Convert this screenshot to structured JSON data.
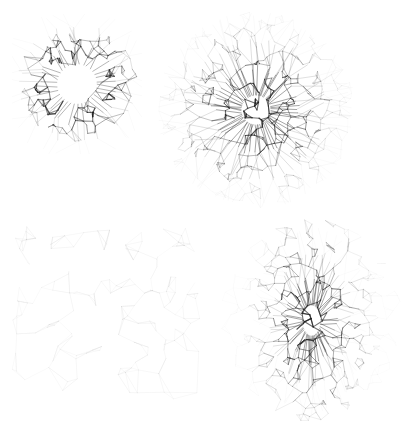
{
  "figure": {
    "background_color": "#ffffff",
    "ink_color": "#202020",
    "width": 417,
    "height": 430,
    "layout": "2x2 grid of unlabeled raster panels",
    "caption": ""
  },
  "panels": [
    {
      "id": "panel-top-left",
      "name": "toroidal-shell",
      "position": "top-left",
      "label": "",
      "morphology": "annulus",
      "description": "Ring / torus shaped mesh with open white core and radial spokes projecting outward",
      "x": 12,
      "y": 14,
      "width": 130,
      "height": 140,
      "density": 0.72,
      "core_opacity": 0.0,
      "ring_inner_radius": 22,
      "ring_outer_radius": 58,
      "spoke_count": 34,
      "cell_count": 150
    },
    {
      "id": "panel-top-right",
      "name": "radial-burst-sphere",
      "position": "top-right",
      "label": "",
      "morphology": "spheroid",
      "description": "Dense centrally concentrated spheroidal mesh surrounded by a sparse halo of filaments",
      "x": 158,
      "y": 12,
      "width": 196,
      "height": 196,
      "density": 0.9,
      "core_opacity": 0.85,
      "core_radius": 60,
      "halo_radius": 98,
      "spoke_count": 60,
      "cell_count": 420
    },
    {
      "id": "panel-bottom-left",
      "name": "sparse-network",
      "position": "bottom-left",
      "label": "",
      "morphology": "diffuse-web",
      "description": "Low density open polygonal web of faint filaments spread uniformly across the frame",
      "x": 12,
      "y": 225,
      "width": 188,
      "height": 175,
      "density": 0.22,
      "core_opacity": 0.0,
      "cell_count": 150
    },
    {
      "id": "panel-bottom-right",
      "name": "elongated-filament",
      "position": "bottom-right",
      "label": "",
      "morphology": "prolate",
      "description": "Vertically elongated dense filamentary column with sparse surrounding field",
      "x": 215,
      "y": 218,
      "width": 193,
      "height": 205,
      "density": 0.88,
      "core_opacity": 0.8,
      "core_radius_x": 52,
      "core_radius_y": 88,
      "spoke_count": 52,
      "cell_count": 400
    }
  ]
}
